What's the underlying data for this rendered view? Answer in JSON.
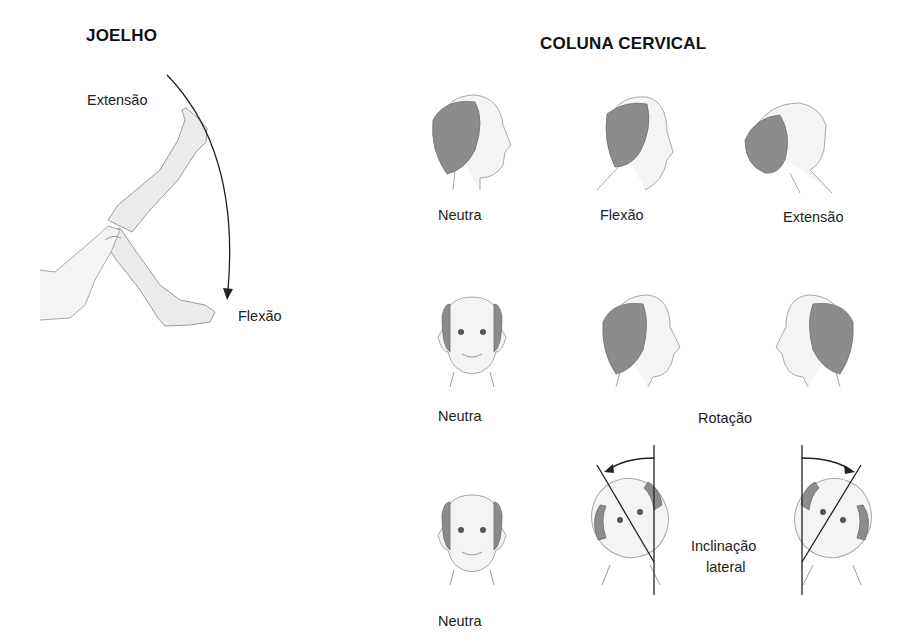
{
  "knee": {
    "title": "JOELHO",
    "labels": {
      "extension": "Extensão",
      "flexion": "Flexão"
    }
  },
  "cervical_spine": {
    "title": "COLUNA CERVICAL",
    "rows": [
      {
        "figures": [
          "neutral-profile",
          "flexion-profile",
          "extension-profile"
        ],
        "labels": [
          "Neutra",
          "Flexão",
          "Extensão"
        ]
      },
      {
        "figures": [
          "neutral-front",
          "rotation-right",
          "rotation-left"
        ],
        "labels": [
          "Neutra",
          "Rotação"
        ]
      },
      {
        "figures": [
          "neutral-front",
          "lateral-tilt-left",
          "lateral-tilt-right"
        ],
        "labels": [
          "Neutra",
          "Inclinação",
          "lateral"
        ]
      }
    ]
  }
}
